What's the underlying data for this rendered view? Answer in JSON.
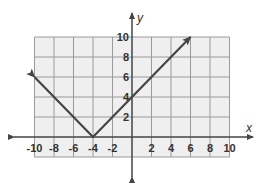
{
  "chart_data": {
    "type": "line",
    "title": "",
    "xlabel": "x",
    "ylabel": "y",
    "xlim": [
      -10,
      10
    ],
    "ylim": [
      -2,
      10
    ],
    "grid": true,
    "grid_step": 2,
    "x_ticks": [
      -10,
      -8,
      -6,
      -4,
      -2,
      2,
      4,
      6,
      8,
      10
    ],
    "y_ticks": [
      2,
      4,
      6,
      8,
      10
    ],
    "series": [
      {
        "name": "absolute value function",
        "points": [
          [
            -10,
            6
          ],
          [
            -4,
            0
          ],
          [
            6,
            10
          ]
        ],
        "arrow_ends": true
      }
    ]
  },
  "colors": {
    "grid_bg": "#efefef",
    "grid_line": "#9a9a9a",
    "axis": "#444444",
    "curve": "#444444"
  }
}
